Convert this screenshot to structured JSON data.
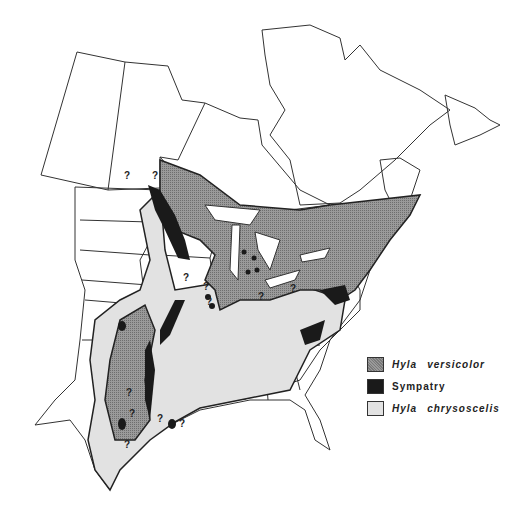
{
  "figure": {
    "type": "species range map",
    "region": "Eastern North America"
  },
  "legend": {
    "items": [
      {
        "genus": "Hyla",
        "species": "versicolor",
        "label": "Hyla versicolor",
        "color": "#8a8a8a",
        "pattern": "stippled gray"
      },
      {
        "genus": "",
        "species": "",
        "label": "Sympatry",
        "color": "#1a1a1a",
        "pattern": "solid black"
      },
      {
        "genus": "Hyla",
        "species": "chrysoscelis",
        "label": "Hyla chrysoscelis",
        "color": "#e2e2e2",
        "pattern": "light gray"
      }
    ]
  },
  "annotations": {
    "uncertain_marker": "?"
  },
  "colors": {
    "outline": "#333333",
    "background": "#ffffff",
    "lakes": "#ffffff"
  }
}
